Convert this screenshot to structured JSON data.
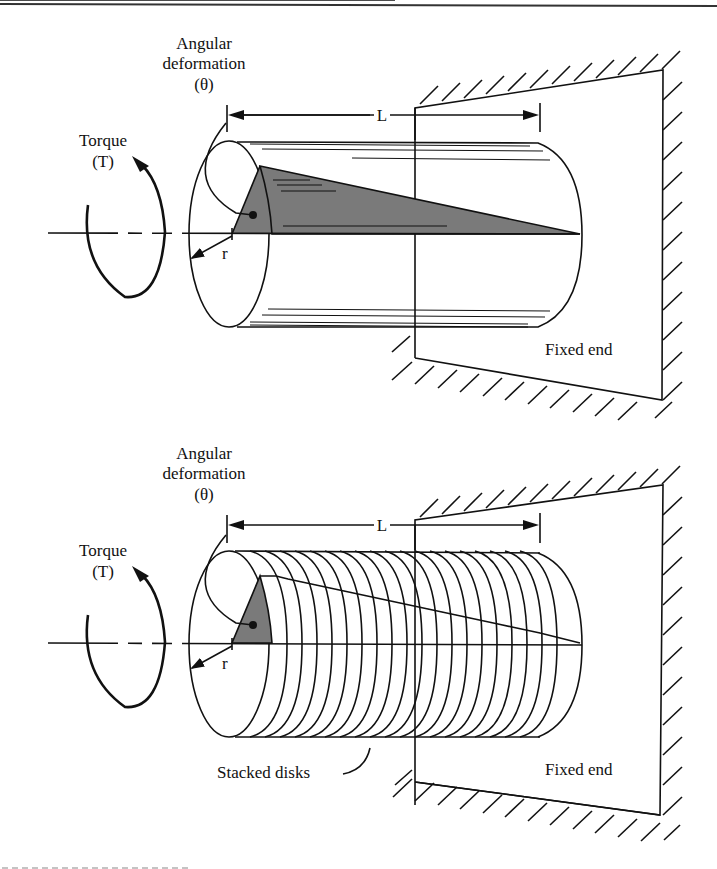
{
  "figure": {
    "top_panel": {
      "angular_label_line1": "Angular",
      "angular_label_line2": "deformation",
      "angular_label_line3": "(θ)",
      "torque_label_line1": "Torque",
      "torque_label_line2": "(T)",
      "length_label": "L",
      "radius_label": "r",
      "fixed_end_label": "Fixed end"
    },
    "bottom_panel": {
      "angular_label_line1": "Angular",
      "angular_label_line2": "deformation",
      "angular_label_line3": "(θ)",
      "torque_label_line1": "Torque",
      "torque_label_line2": "(T)",
      "length_label": "L",
      "radius_label": "r",
      "fixed_end_label": "Fixed end",
      "disks_label": "Stacked disks",
      "disk_count": 20
    },
    "colors": {
      "line": "#111111",
      "shade": "#7a7a7a",
      "background": "#ffffff"
    }
  }
}
